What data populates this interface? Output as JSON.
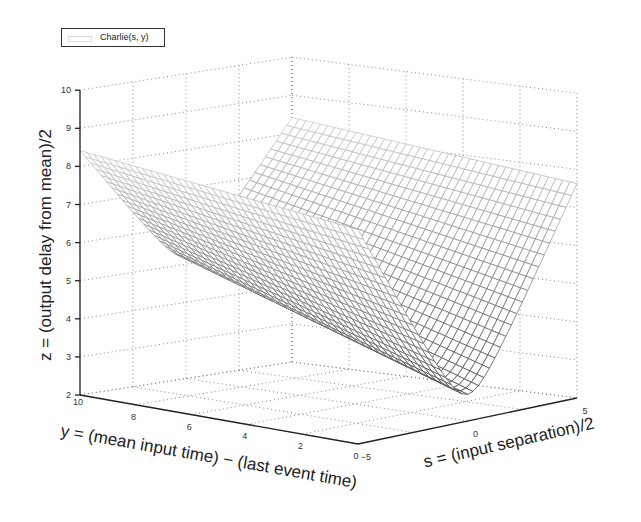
{
  "chart_data": {
    "type": "surface",
    "title": "",
    "legend": [
      "Charlie(s, y)"
    ],
    "legend_position": "top-left",
    "xlabel": "s = (input separation)/2",
    "ylabel": "y = (mean input time) − (last event time)",
    "zlabel": "z = (output delay from mean)/2",
    "s_ticks": [
      -5,
      0,
      5
    ],
    "y_ticks": [
      0,
      2,
      4,
      6,
      8,
      10
    ],
    "z_ticks": [
      2,
      3,
      4,
      5,
      6,
      7,
      8,
      9,
      10
    ],
    "s_range": [
      -5,
      5
    ],
    "y_range": [
      0,
      10
    ],
    "zlim": [
      2,
      10
    ],
    "grid": true,
    "mesh_color_scheme": "grayscale (light at high z, dark at low z)",
    "surface_description": "V-shaped valley along s=0; z rises roughly linearly with |s|; valley floor lowest near y=0 (z~2.7) and rising to ~5 at y=10; edges reach ~8.5-9 at |s|=5",
    "sample_points": [
      {
        "s": -5,
        "y": 10,
        "z": 8.6
      },
      {
        "s": 0,
        "y": 10,
        "z": 5.2
      },
      {
        "s": 5,
        "y": 10,
        "z": 9.0
      },
      {
        "s": -5,
        "y": 0,
        "z": 7.5
      },
      {
        "s": 0,
        "y": 0,
        "z": 2.7
      },
      {
        "s": 5,
        "y": 0,
        "z": 8.4
      }
    ]
  },
  "axes": {
    "z_tick_labels": [
      "2",
      "3",
      "4",
      "5",
      "6",
      "7",
      "8",
      "9",
      "10"
    ],
    "y_tick_labels": [
      "10",
      "8",
      "6",
      "4",
      "2",
      "0"
    ],
    "s_tick_labels": [
      "-5",
      "0",
      "5"
    ]
  },
  "legend": {
    "label": "Charlie(s, y)"
  }
}
